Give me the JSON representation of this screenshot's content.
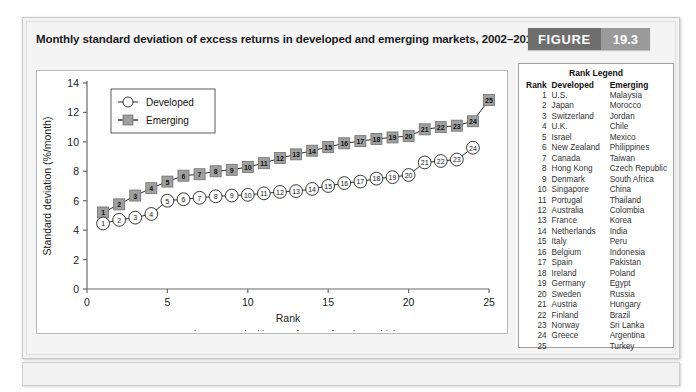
{
  "figure": {
    "title": "Monthly standard deviation of excess returns in developed and emerging markets, 2002–2011",
    "badge_label": "FIGURE",
    "badge_number": "19.3"
  },
  "rank_legend": {
    "title": "Rank Legend",
    "headers": [
      "Rank",
      "Developed",
      "Emerging"
    ],
    "rows": [
      {
        "rank": "1",
        "developed": "U.S.",
        "emerging": "Malaysia"
      },
      {
        "rank": "2",
        "developed": "Japan",
        "emerging": "Morocco"
      },
      {
        "rank": "3",
        "developed": "Switzerland",
        "emerging": "Jordan"
      },
      {
        "rank": "4",
        "developed": "U.K.",
        "emerging": "Chile"
      },
      {
        "rank": "5",
        "developed": "Israel",
        "emerging": "Mexico"
      },
      {
        "rank": "6",
        "developed": "New Zealand",
        "emerging": "Philippines"
      },
      {
        "rank": "7",
        "developed": "Canada",
        "emerging": "Taiwan"
      },
      {
        "rank": "8",
        "developed": "Hong Kong",
        "emerging": "Czech Republic"
      },
      {
        "rank": "9",
        "developed": "Denmark",
        "emerging": "South Africa"
      },
      {
        "rank": "10",
        "developed": "Singapore",
        "emerging": "China"
      },
      {
        "rank": "11",
        "developed": "Portugal",
        "emerging": "Thailand"
      },
      {
        "rank": "12",
        "developed": "Australia",
        "emerging": "Colombia"
      },
      {
        "rank": "13",
        "developed": "France",
        "emerging": "Korea"
      },
      {
        "rank": "14",
        "developed": "Netherlands",
        "emerging": "India"
      },
      {
        "rank": "15",
        "developed": "Italy",
        "emerging": "Peru"
      },
      {
        "rank": "16",
        "developed": "Belgium",
        "emerging": "Indonesia"
      },
      {
        "rank": "17",
        "developed": "Spain",
        "emerging": "Pakistan"
      },
      {
        "rank": "18",
        "developed": "Ireland",
        "emerging": "Poland"
      },
      {
        "rank": "19",
        "developed": "Germany",
        "emerging": "Egypt"
      },
      {
        "rank": "20",
        "developed": "Sweden",
        "emerging": "Russia"
      },
      {
        "rank": "21",
        "developed": "Austria",
        "emerging": "Hungary"
      },
      {
        "rank": "22",
        "developed": "Finland",
        "emerging": "Brazil"
      },
      {
        "rank": "23",
        "developed": "Norway",
        "emerging": "Sri Lanka"
      },
      {
        "rank": "24",
        "developed": "Greece",
        "emerging": "Argentina"
      },
      {
        "rank": "25",
        "developed": "",
        "emerging": "Turkey"
      }
    ]
  },
  "chart_data": {
    "type": "line",
    "title": "",
    "xlabel": "Rank",
    "ylabel": "Standard deviation (%/month)",
    "subcaption": "Markets are ranked by SD of return, from low to high",
    "xlim": [
      0,
      25
    ],
    "ylim": [
      0,
      14
    ],
    "xticks": [
      0,
      5,
      10,
      15,
      20,
      25
    ],
    "yticks": [
      0,
      2,
      4,
      6,
      8,
      10,
      12,
      14
    ],
    "grid": false,
    "legend_position": "upper-left",
    "x": [
      1,
      2,
      3,
      4,
      5,
      6,
      7,
      8,
      9,
      10,
      11,
      12,
      13,
      14,
      15,
      16,
      17,
      18,
      19,
      20,
      21,
      22,
      23,
      24,
      25
    ],
    "series": [
      {
        "name": "Developed",
        "marker": "circle",
        "color": "#ffffff",
        "edge_color": "#222222",
        "values": [
          4.45,
          4.7,
          4.85,
          5.1,
          6.0,
          6.1,
          6.2,
          6.3,
          6.35,
          6.4,
          6.5,
          6.6,
          6.65,
          6.8,
          7.0,
          7.2,
          7.3,
          7.5,
          7.6,
          7.75,
          8.6,
          8.7,
          8.8,
          9.6,
          null
        ]
      },
      {
        "name": "Emerging",
        "marker": "square",
        "color": "#9f9f9f",
        "edge_color": "#6f6f6f",
        "values": [
          5.2,
          5.75,
          6.35,
          6.85,
          7.3,
          7.7,
          7.8,
          8.0,
          8.1,
          8.3,
          8.55,
          8.9,
          9.15,
          9.4,
          9.65,
          9.9,
          10.05,
          10.2,
          10.3,
          10.4,
          10.85,
          11.0,
          11.1,
          11.4,
          12.85
        ]
      }
    ]
  }
}
